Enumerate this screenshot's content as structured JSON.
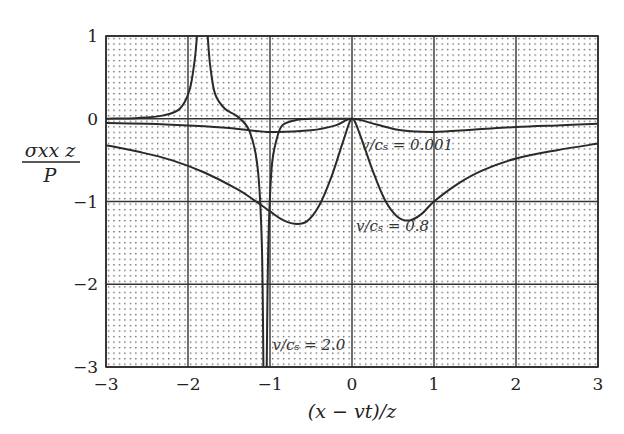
{
  "chart_data": {
    "type": "line",
    "title": "",
    "xlabel": "(x − vt)/z",
    "ylabel_num": "σxx z",
    "ylabel_den": "P",
    "xlim": [
      -3,
      3
    ],
    "ylim": [
      -3,
      1
    ],
    "xticks": [
      -3,
      -2,
      -1,
      0,
      1,
      2,
      3
    ],
    "xtick_labels": [
      "−3",
      "−2",
      "−1",
      "0",
      "1",
      "2",
      "3"
    ],
    "yticks": [
      1,
      0,
      -1,
      -2,
      -3
    ],
    "ytick_labels": [
      "1",
      "0",
      "−1",
      "−2",
      "−3"
    ],
    "grid": true,
    "background": "dotted",
    "series": [
      {
        "name": "v/cs = 0.001",
        "label": "v/cₛ = 0.001",
        "label_pos": [
          0.11,
          -0.38
        ],
        "x": [
          -3,
          -2.5,
          -2,
          -1.5,
          -1,
          -0.5,
          -0.2,
          0,
          0.3,
          0.6,
          1,
          1.5,
          2,
          2.5,
          3
        ],
        "y": [
          -0.05,
          -0.06,
          -0.08,
          -0.11,
          -0.16,
          -0.14,
          -0.08,
          0,
          -0.07,
          -0.14,
          -0.16,
          -0.13,
          -0.1,
          -0.08,
          -0.06
        ]
      },
      {
        "name": "v/cs = 0.8",
        "label": "v/cₛ = 0.8",
        "label_pos": [
          0.05,
          -1.36
        ],
        "x": [
          -3,
          -2.6,
          -2.2,
          -1.8,
          -1.4,
          -1.2,
          -1.0,
          -0.85,
          -0.7,
          -0.55,
          -0.4,
          -0.25,
          -0.1,
          0,
          0.1,
          0.25,
          0.4,
          0.55,
          0.7,
          0.85,
          1.0,
          1.3,
          1.6,
          2.0,
          2.5,
          3
        ],
        "y": [
          -0.32,
          -0.4,
          -0.5,
          -0.65,
          -0.85,
          -0.98,
          -1.12,
          -1.22,
          -1.27,
          -1.24,
          -1.05,
          -0.7,
          -0.25,
          0,
          -0.2,
          -0.62,
          -0.98,
          -1.18,
          -1.23,
          -1.15,
          -1.0,
          -0.78,
          -0.62,
          -0.48,
          -0.38,
          -0.3
        ]
      },
      {
        "name": "v/cs = 2.0",
        "label": "v/cₛ = 2.0",
        "label_pos": [
          -0.97,
          -2.8
        ],
        "segments": [
          {
            "x": [
              -3,
              -2.6,
              -2.3,
              -2.1,
              -1.98,
              -1.92,
              -1.89
            ],
            "y": [
              0.0,
              0.01,
              0.04,
              0.12,
              0.35,
              0.7,
              1.0
            ]
          },
          {
            "x": [
              -1.76,
              -1.73,
              -1.67,
              -1.55,
              -1.4,
              -1.25,
              -1.15,
              -1.1,
              -1.08
            ],
            "y": [
              1.0,
              0.65,
              0.3,
              0.12,
              0.03,
              -0.15,
              -0.6,
              -1.5,
              -3.0
            ]
          },
          {
            "x": [
              -1.04,
              -1.02,
              -0.98,
              -0.92,
              -0.85,
              -0.7,
              -0.5,
              -0.3,
              -0.15,
              0
            ],
            "y": [
              -3.0,
              -1.5,
              -0.6,
              -0.25,
              -0.08,
              -0.02,
              0.0,
              0.0,
              0.0,
              0.0
            ]
          }
        ]
      }
    ],
    "colors": {
      "line": "#2a2a2a",
      "grid": "#333333",
      "dot": "#555555",
      "background": "#ffffff"
    }
  }
}
